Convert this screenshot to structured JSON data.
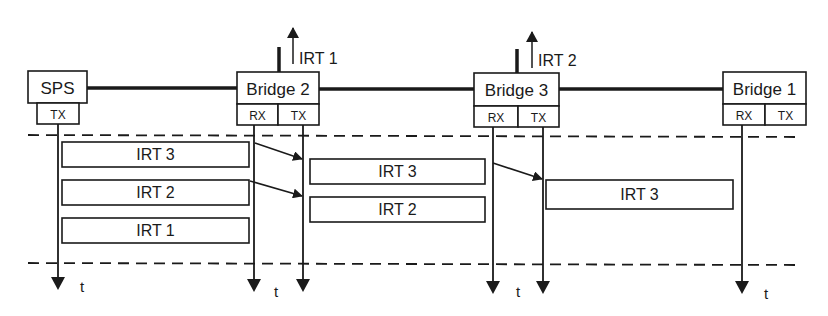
{
  "diagram": {
    "type": "timing-diagram",
    "colors": {
      "stroke": "#1a1a1a",
      "background": "#ffffff"
    },
    "nodes": [
      {
        "id": "sps",
        "label": "SPS",
        "ports": [
          "TX"
        ]
      },
      {
        "id": "bridge2",
        "label": "Bridge 2",
        "ports": [
          "RX",
          "TX"
        ],
        "output_label": "IRT 1"
      },
      {
        "id": "bridge3",
        "label": "Bridge 3",
        "ports": [
          "RX",
          "TX"
        ],
        "output_label": "IRT 2"
      },
      {
        "id": "bridge1",
        "label": "Bridge 1",
        "ports": [
          "RX",
          "TX"
        ]
      }
    ],
    "frames": {
      "sps_tx": [
        "IRT 3",
        "IRT 2",
        "IRT 1"
      ],
      "bridge2_tx": [
        "IRT 3",
        "IRT 2"
      ],
      "bridge3_tx": [
        "IRT 3"
      ]
    },
    "time_label": "t"
  }
}
